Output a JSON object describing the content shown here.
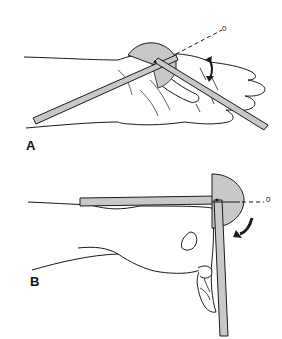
{
  "figure": {
    "panels": [
      {
        "label": "A",
        "description": "Goniometer measuring wrist/finger joint flexion with hand flat; arms diverging, dashed zero reference line",
        "zero_marker": "0"
      },
      {
        "label": "B",
        "description": "Goniometer measuring joint with forearm horizontal and hand flexed downward; curved arrow showing direction of motion",
        "zero_marker": "0"
      }
    ],
    "colors": {
      "goniometer_fill": "#c8c8c8",
      "line": "#1a1a1a",
      "background": "#ffffff"
    }
  }
}
